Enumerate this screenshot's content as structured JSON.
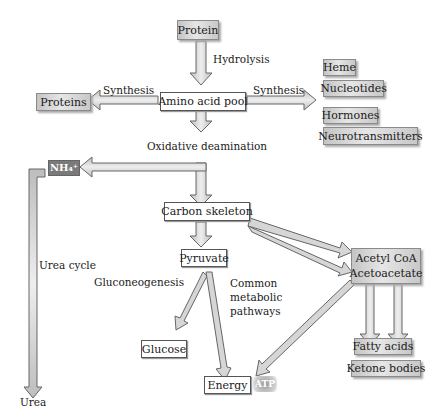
{
  "diagram": {
    "nodes": {
      "protein": "Protein",
      "amino_acid_pool": "Amino acid pool",
      "proteins": "Proteins",
      "heme": "Heme",
      "nucleotides": "Nucleotides",
      "hormones": "Hormones",
      "neurotransmitters": "Neurotransmitters",
      "nh4": "NH₄⁺",
      "carbon_skeleton": "Carbon skeleton",
      "pyruvate": "Pyruvate",
      "acetyl_coa": "Acetyl CoA",
      "acetoacetate": "Acetoacetate",
      "glucose": "Glucose",
      "energy": "Energy",
      "atp": "ATP",
      "fatty_acids": "Fatty acids",
      "ketone_bodies": "Ketone bodies",
      "urea": "Urea"
    },
    "labels": {
      "hydrolysis": "Hydrolysis",
      "synthesis_left": "Synthesis",
      "synthesis_right": "Synthesis",
      "oxidative_deamination": "Oxidative deamination",
      "urea_cycle": "Urea cycle",
      "gluconeogenesis": "Gluconeogenesis",
      "common_1": "Common",
      "common_2": "metabolic",
      "common_3": "pathways"
    }
  }
}
